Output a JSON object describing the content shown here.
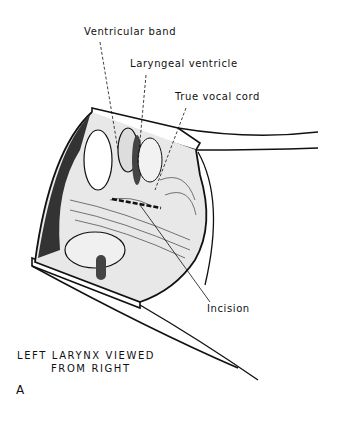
{
  "figure": {
    "labels": {
      "ventricular_band": "Ventricular band",
      "laryngeal_ventricle": "Laryngeal ventricle",
      "true_vocal_cord": "True vocal cord",
      "incision": "Incision"
    },
    "caption_line1": "LEFT LARYNX VIEWED",
    "caption_line2": "FROM RIGHT",
    "panel_letter": "A"
  }
}
